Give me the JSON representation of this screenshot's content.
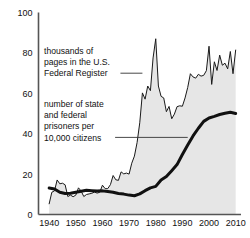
{
  "chart_data": {
    "type": "line",
    "title": "",
    "xlabel": "",
    "ylabel": "",
    "xlim": [
      1936,
      2012
    ],
    "ylim": [
      0,
      100
    ],
    "grid": false,
    "legend_position": "inline-annotations",
    "yticks": [
      0,
      20,
      40,
      60,
      80,
      100
    ],
    "xticks": [
      1940,
      1950,
      1960,
      1970,
      1980,
      1990,
      2000,
      2010
    ],
    "ytick_labels": [
      "0",
      "20",
      "40",
      "60",
      "80",
      "100"
    ],
    "xtick_labels": [
      "1940",
      "1950",
      "1960",
      "1970",
      "1980",
      "1990",
      "2000",
      "2010"
    ],
    "annotations": [
      {
        "name": "federal-register-label",
        "lines": [
          "thousands of",
          "pages in the U.S.",
          "Federal Register"
        ],
        "leader_from_year": 1966,
        "leader_to_year": 1975,
        "leader_value": 64
      },
      {
        "name": "prisoners-label",
        "lines": [
          "number of state",
          "and federal",
          "prisoners per",
          "10,000 citizens"
        ],
        "leader_from_year": 1964,
        "leader_to_year": 1992,
        "leader_value": 37
      }
    ],
    "series": [
      {
        "name": "thousands of pages in the U.S. Federal Register",
        "style": "thin-line-with-fill",
        "fill_color": "#e6e6e6",
        "line_color": "#1a1a1a",
        "line_width": 1,
        "x": [
          1940,
          1941,
          1942,
          1943,
          1944,
          1945,
          1946,
          1947,
          1948,
          1949,
          1950,
          1951,
          1952,
          1953,
          1954,
          1955,
          1956,
          1957,
          1958,
          1959,
          1960,
          1961,
          1962,
          1963,
          1964,
          1965,
          1966,
          1967,
          1968,
          1969,
          1970,
          1971,
          1972,
          1973,
          1974,
          1975,
          1976,
          1977,
          1978,
          1979,
          1980,
          1981,
          1982,
          1983,
          1984,
          1985,
          1986,
          1987,
          1988,
          1989,
          1990,
          1991,
          1992,
          1993,
          1994,
          1995,
          1996,
          1997,
          1998,
          1999,
          2000,
          2001,
          2002,
          2003,
          2004,
          2005,
          2006,
          2007,
          2008,
          2009,
          2010
        ],
        "y": [
          5.3,
          11.0,
          11.7,
          17.1,
          15.2,
          15.5,
          14.7,
          8.9,
          9.6,
          8.8,
          9.6,
          13.2,
          11.6,
          8.9,
          9.9,
          10.2,
          10.5,
          11.1,
          10.6,
          11.0,
          14.5,
          12.8,
          12.8,
          14.8,
          19.3,
          17.2,
          16.9,
          21.1,
          20.1,
          20.5,
          20.0,
          25.4,
          28.9,
          35.6,
          45.4,
          60.2,
          57.1,
          63.6,
          61.3,
          77.5,
          87.0,
          63.6,
          58.5,
          57.7,
          50.9,
          53.5,
          47.4,
          49.7,
          53.4,
          53.8,
          53.6,
          57.7,
          62.9,
          69.7,
          68.1,
          67.5,
          69.4,
          68.5,
          68.9,
          71.2,
          83.3,
          64.4,
          75.6,
          71.3,
          78.9,
          73.9,
          74.9,
          72.1,
          80.7,
          69.7,
          81.4
        ]
      },
      {
        "name": "number of state and federal prisoners per 10,000 citizens",
        "style": "thick-line",
        "line_color": "#111111",
        "line_width": 3,
        "x": [
          1940,
          1942,
          1944,
          1946,
          1948,
          1950,
          1952,
          1954,
          1956,
          1958,
          1960,
          1962,
          1964,
          1966,
          1968,
          1970,
          1972,
          1974,
          1976,
          1978,
          1980,
          1982,
          1984,
          1986,
          1988,
          1990,
          1992,
          1994,
          1996,
          1998,
          2000,
          2002,
          2004,
          2006,
          2008,
          2010
        ],
        "y": [
          13.1,
          12.6,
          11.0,
          10.4,
          10.5,
          11.0,
          11.5,
          12.0,
          11.8,
          11.6,
          11.7,
          11.4,
          11.0,
          10.4,
          10.1,
          9.6,
          9.3,
          10.2,
          11.8,
          13.2,
          13.9,
          17.1,
          18.8,
          21.7,
          24.7,
          29.7,
          34.4,
          38.9,
          42.7,
          46.1,
          47.8,
          48.6,
          49.5,
          50.1,
          50.6,
          50.0
        ]
      }
    ]
  }
}
